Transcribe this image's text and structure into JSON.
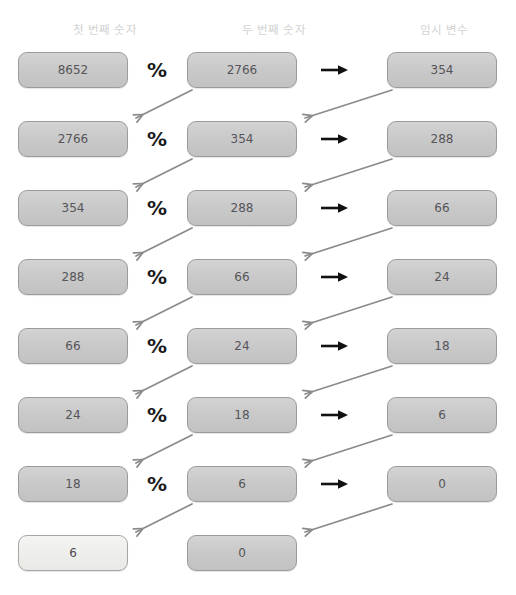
{
  "diagram": {
    "columns": [
      {
        "label": "첫 번째 숫자"
      },
      {
        "label": "두 번째 숫자"
      },
      {
        "label": "임시 변수"
      }
    ],
    "operators": {
      "modulo": "%",
      "assign": "→"
    },
    "colors": {
      "box_fill": "#c9c9c9",
      "box_border": "#9b9b9b",
      "box_text": "#55555a",
      "header_text": "#d2d2d2",
      "highlight_fill": "#eeeeec",
      "arrow_diagonal": "#8a8a8a",
      "arrow_assign": "#1a1a1a",
      "background": "#ffffff"
    },
    "rows": [
      {
        "first": "8652",
        "second": "2766",
        "temp": "354",
        "show_ops": true,
        "highlight_first": false
      },
      {
        "first": "2766",
        "second": "354",
        "temp": "288",
        "show_ops": true,
        "highlight_first": false
      },
      {
        "first": "354",
        "second": "288",
        "temp": "66",
        "show_ops": true,
        "highlight_first": false
      },
      {
        "first": "288",
        "second": "66",
        "temp": "24",
        "show_ops": true,
        "highlight_first": false
      },
      {
        "first": "66",
        "second": "24",
        "temp": "18",
        "show_ops": true,
        "highlight_first": false
      },
      {
        "first": "24",
        "second": "18",
        "temp": "6",
        "show_ops": true,
        "highlight_first": false
      },
      {
        "first": "18",
        "second": "6",
        "temp": "0",
        "show_ops": true,
        "highlight_first": false
      },
      {
        "first": "6",
        "second": "0",
        "temp": null,
        "show_ops": false,
        "highlight_first": true
      }
    ]
  },
  "chart_data": {
    "type": "table",
    "columns": [
      "첫 번째 숫자",
      "두 번째 숫자",
      "임시 변수"
    ],
    "rows": [
      [
        "8652",
        "2766",
        "354"
      ],
      [
        "2766",
        "354",
        "288"
      ],
      [
        "354",
        "288",
        "66"
      ],
      [
        "288",
        "66",
        "24"
      ],
      [
        "66",
        "24",
        "18"
      ],
      [
        "24",
        "18",
        "6"
      ],
      [
        "18",
        "6",
        "0"
      ],
      [
        "6",
        "0",
        ""
      ]
    ],
    "result": "6"
  }
}
